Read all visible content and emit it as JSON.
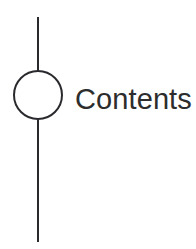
{
  "page": {
    "title": "Contents",
    "background_color": "#ffffff",
    "width": 196,
    "height": 249
  },
  "heading": {
    "label": "Contents",
    "color": "#2d2d2d"
  },
  "diagram": {
    "stroke_color": "#2a2a2e",
    "stroke_width": 2,
    "marker": {
      "shape": "circle",
      "center_x": 38,
      "center_y": 95,
      "radius": 24,
      "fill": "#ffffff"
    },
    "rule": {
      "orientation": "vertical",
      "x": 38,
      "top_y": 17,
      "bottom_y": 242
    }
  }
}
